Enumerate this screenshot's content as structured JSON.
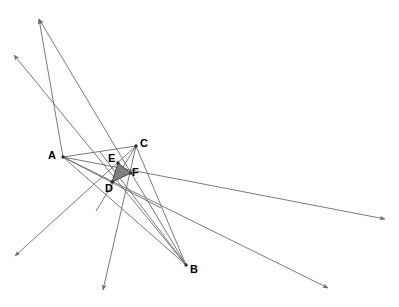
{
  "canvas": {
    "width": 399,
    "height": 307,
    "background": "#ffffff"
  },
  "style": {
    "line_color": "#6b6b6b",
    "line_width": 0.9,
    "arrow_color": "#6b6b6b",
    "shaded_fill": "#808080",
    "shaded_stroke": "#4a4a4a",
    "label_color": "#000000",
    "vertex_dot_color": "#2b2b2b"
  },
  "points": {
    "A": {
      "label": "A",
      "x": 63,
      "y": 157,
      "label_x": 48,
      "label_y": 150
    },
    "B": {
      "label": "B",
      "x": 186,
      "y": 265,
      "label_x": 190,
      "label_y": 264
    },
    "C": {
      "label": "C",
      "x": 136,
      "y": 146,
      "label_x": 140,
      "label_y": 138
    },
    "D": {
      "label": "D",
      "x": 112,
      "y": 182,
      "label_x": 105,
      "label_y": 183
    },
    "E": {
      "label": "E",
      "x": 118,
      "y": 163,
      "label_x": 108,
      "label_y": 153
    },
    "F": {
      "label": "F",
      "x": 131,
      "y": 173,
      "label_x": 132,
      "label_y": 167
    }
  },
  "shaded_triangle": {
    "name": "triangle-DEF",
    "vertices": [
      "E",
      "F",
      "D"
    ],
    "fill": "#808080",
    "stroke": "#4a4a4a"
  },
  "triangle_sides": [
    {
      "name": "side-AC",
      "from": "A",
      "to": "C"
    },
    {
      "name": "side-AB",
      "from": "A",
      "to": "B"
    },
    {
      "name": "side-CB",
      "from": "C",
      "to": "B"
    }
  ],
  "rays": [
    {
      "name": "ray-A-upper-left-1",
      "x1": 63,
      "y1": 157,
      "x2": 39,
      "y2": 19,
      "arrow_at_end": true,
      "note": "long ray from A toward top-left, reversed direction"
    },
    {
      "name": "ray-A-to-bottom-right",
      "x1": 63,
      "y1": 157,
      "x2": 328,
      "y2": 288,
      "arrow_at_end": true
    },
    {
      "name": "ray-A-to-right-far",
      "x1": 63,
      "y1": 157,
      "x2": 385,
      "y2": 219,
      "arrow_at_end": true
    },
    {
      "name": "ray-C-to-bottom-left",
      "x1": 136,
      "y1": 146,
      "x2": 15,
      "y2": 256,
      "arrow_at_end": true
    },
    {
      "name": "ray-B-to-top-left-upper",
      "x1": 186,
      "y1": 265,
      "x2": 39,
      "y2": 19,
      "arrow_at_end": true
    },
    {
      "name": "ray-B-to-top-left-lower",
      "x1": 186,
      "y1": 265,
      "x2": 14,
      "y2": 55,
      "arrow_at_end": true
    },
    {
      "name": "ray-C-to-bottom-center",
      "x1": 136,
      "y1": 146,
      "x2": 103,
      "y2": 290,
      "arrow_at_end": true
    }
  ],
  "cevians": [
    {
      "name": "cevian-A-to-CB",
      "from": "A",
      "to_x": 161,
      "to_y": 208
    },
    {
      "name": "cevian-C-to-AB",
      "from": "C",
      "to_x": 96,
      "to_y": 211
    },
    {
      "name": "cevian-B-to-AC",
      "from": "B",
      "to_x": 100,
      "to_y": 152
    }
  ],
  "figure": {
    "type": "geometry-construction",
    "vertex_order": [
      "A",
      "B",
      "C",
      "D",
      "E",
      "F"
    ]
  }
}
